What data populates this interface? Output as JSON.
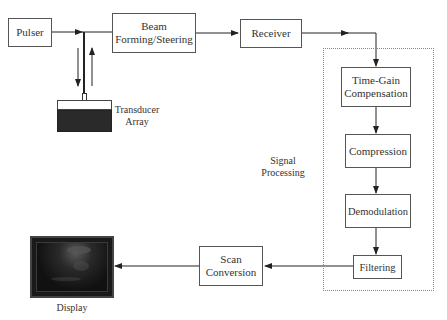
{
  "diagram": {
    "nodes": {
      "pulser": "Pulser",
      "beam_forming": "Beam Forming/Steering",
      "receiver": "Receiver",
      "tgc": "Time-Gain Compensation",
      "compression": "Compression",
      "demodulation": "Demodulation",
      "filtering": "Filtering",
      "scan_conversion": "Scan Conversion",
      "transducer": "Transducer Array",
      "display": "Display"
    },
    "group_label": "Signal Processing",
    "edges": [
      [
        "Pulser",
        "Beam Forming/Steering"
      ],
      [
        "Transducer Array",
        "Beam Forming/Steering (bidirectional)"
      ],
      [
        "Beam Forming/Steering",
        "Receiver"
      ],
      [
        "Receiver",
        "Time-Gain Compensation"
      ],
      [
        "Time-Gain Compensation",
        "Compression"
      ],
      [
        "Compression",
        "Demodulation"
      ],
      [
        "Demodulation",
        "Filtering"
      ],
      [
        "Filtering",
        "Scan Conversion"
      ],
      [
        "Scan Conversion",
        "Display"
      ]
    ],
    "colors": {
      "line": "#222222",
      "box_border": "#555555",
      "group_border": "#888888"
    }
  }
}
